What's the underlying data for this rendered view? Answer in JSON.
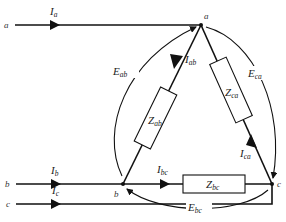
{
  "diagram": {
    "lines": {
      "a": {
        "label": "a",
        "current": "I",
        "current_sub": "a"
      },
      "b": {
        "label": "b",
        "current": "I",
        "current_sub": "b"
      },
      "c": {
        "label": "c",
        "current": "I",
        "current_sub": "c"
      }
    },
    "nodes": {
      "a": "a",
      "b": "b",
      "c": "c"
    },
    "branches": {
      "ab": {
        "impedance": "Z",
        "impedance_sub": "ab",
        "current": "I",
        "current_sub": "ab",
        "voltage": "E",
        "voltage_sub": "ab"
      },
      "bc": {
        "impedance": "Z",
        "impedance_sub": "bc",
        "current": "I",
        "current_sub": "bc",
        "voltage": "E",
        "voltage_sub": "bc"
      },
      "ca": {
        "impedance": "Z",
        "impedance_sub": "ca",
        "current": "I",
        "current_sub": "ca",
        "voltage": "E",
        "voltage_sub": "ca"
      }
    },
    "colors": {
      "stroke": "#111111",
      "background": "#ffffff"
    }
  }
}
